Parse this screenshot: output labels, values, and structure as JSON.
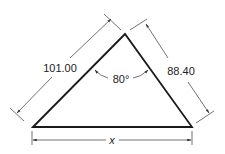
{
  "diagram": {
    "type": "triangle-dimension-drawing",
    "vertices": {
      "bottom_left": [
        33,
        127
      ],
      "apex": [
        125,
        34
      ],
      "bottom_right": [
        192,
        127
      ]
    },
    "labels": {
      "left_side": "101.00",
      "right_side": "88.40",
      "apex_angle": "80°",
      "base": "x"
    },
    "colors": {
      "line": "#1a1a1a",
      "dimension": "#333333",
      "background": "#ffffff"
    }
  }
}
